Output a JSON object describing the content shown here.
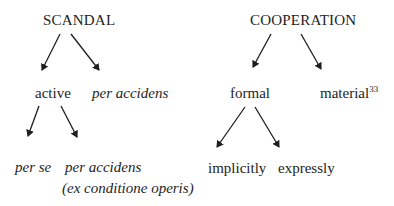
{
  "scandal": {
    "root": "SCANDAL",
    "children": [
      {
        "label": "active",
        "children": [
          {
            "label": "per se"
          },
          {
            "label": "per accidens",
            "sublabel": "(ex conditione operis)"
          }
        ]
      },
      {
        "label": "per accidens"
      }
    ]
  },
  "cooperation": {
    "root": "COOPERATION",
    "children": [
      {
        "label": "formal",
        "children": [
          {
            "label": "implicitly"
          },
          {
            "label": "expressly"
          }
        ]
      },
      {
        "label": "material",
        "footnote": "33"
      }
    ]
  },
  "colors": {
    "text": "#1e1e1e",
    "arrow": "#1e1e1e",
    "background": "#ffffff"
  }
}
